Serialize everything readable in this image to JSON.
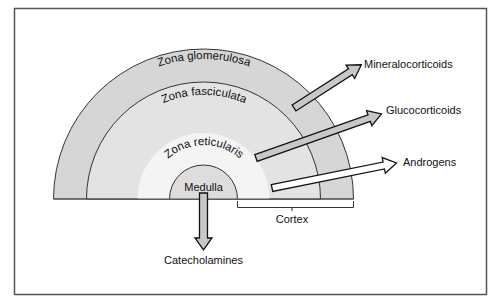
{
  "diagram": {
    "zones": [
      {
        "id": "glomerulosa",
        "label": "Zona glomerulosa",
        "radius": 150,
        "fill": "#d6d6d6"
      },
      {
        "id": "fasciculata",
        "label": "Zona fasciculata",
        "radius": 117,
        "fill": "#e3e3e3"
      },
      {
        "id": "reticularis",
        "label": "Zona reticularis",
        "radius": 66,
        "fill": "#f4f4f4"
      },
      {
        "id": "medulla",
        "label": "Medulla",
        "radius": 34,
        "fill": "#dddddd"
      }
    ],
    "bracket": {
      "label": "Cortex"
    },
    "secretions": [
      {
        "from": "glomerulosa",
        "label": "Mineralocorticoids",
        "arrow_fill": "#c8c8c8"
      },
      {
        "from": "fasciculata",
        "label": "Glucocorticoids",
        "arrow_fill": "#c8c8c8"
      },
      {
        "from": "reticularis",
        "label": "Androgens",
        "arrow_fill": "#ffffff"
      },
      {
        "from": "medulla",
        "label": "Catecholamines",
        "arrow_fill": "#c8c8c8"
      }
    ],
    "colors": {
      "frame": "#555555",
      "outline": "#333333"
    }
  }
}
